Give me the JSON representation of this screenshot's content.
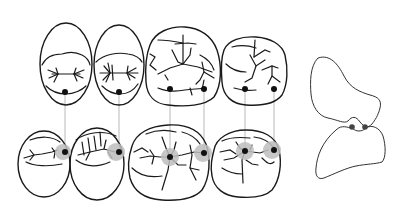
{
  "diagram": {
    "colors": {
      "outline": "#1a1a1a",
      "contact_dot": "#111111",
      "contact_halo": "#bdbdbd",
      "guide_line": "#8a8a8a",
      "background": "#ffffff"
    },
    "upper_row": {
      "teeth": [
        {
          "id": "upper-premolar-1",
          "type": "premolar"
        },
        {
          "id": "upper-premolar-2",
          "type": "premolar"
        },
        {
          "id": "upper-molar-1",
          "type": "molar"
        },
        {
          "id": "upper-molar-2",
          "type": "molar"
        }
      ],
      "contact_points": [
        {
          "x": 65,
          "y": 92
        },
        {
          "x": 119,
          "y": 92
        },
        {
          "x": 170,
          "y": 89
        },
        {
          "x": 204,
          "y": 89
        },
        {
          "x": 245,
          "y": 89
        },
        {
          "x": 274,
          "y": 89
        }
      ]
    },
    "lower_row": {
      "teeth": [
        {
          "id": "lower-premolar-1",
          "type": "premolar"
        },
        {
          "id": "lower-premolar-2",
          "type": "premolar"
        },
        {
          "id": "lower-molar-1",
          "type": "molar"
        },
        {
          "id": "lower-molar-2",
          "type": "molar"
        }
      ],
      "contact_points": [
        {
          "x": 65,
          "y": 152
        },
        {
          "x": 119,
          "y": 152
        },
        {
          "x": 170,
          "y": 157
        },
        {
          "x": 204,
          "y": 153
        },
        {
          "x": 245,
          "y": 151
        },
        {
          "x": 274,
          "y": 150
        }
      ]
    },
    "profile_view": {
      "contacts": [
        {
          "x": 352,
          "y": 127
        },
        {
          "x": 365,
          "y": 127
        }
      ]
    }
  }
}
